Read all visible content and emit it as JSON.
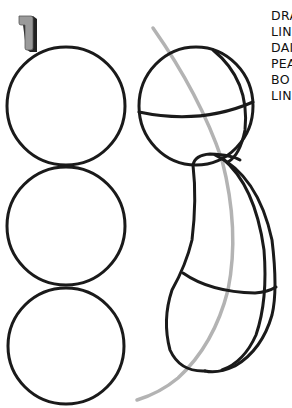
{
  "step": {
    "number": "1",
    "face_color": "#9a9a9a",
    "shadow_color": "#222222"
  },
  "instructions": {
    "lines": [
      "DRA",
      "LIN",
      "DAI",
      "PEA",
      "BO",
      "LIN"
    ]
  },
  "colors": {
    "ink": "#1a1a1a",
    "guide": "#b3b3b3",
    "paper": "#ffffff"
  },
  "figures": {
    "circles": [
      {
        "label": "circle-1",
        "cx": 66,
        "cy": 106,
        "r": 59
      },
      {
        "label": "circle-2",
        "cx": 66,
        "cy": 226,
        "r": 59
      },
      {
        "label": "circle-3",
        "cx": 66,
        "cy": 346,
        "r": 58
      }
    ],
    "head": {
      "cx": 196,
      "cy": 105,
      "r": 58
    },
    "body": "curved bean shape with cross-contour lines",
    "guide_curve": "gray line of action arc"
  }
}
